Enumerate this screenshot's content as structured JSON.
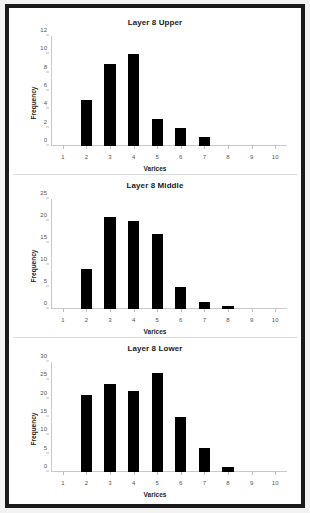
{
  "figure": {
    "background": "#ffffff",
    "frame_color": "#1a1a1a",
    "bar_color": "#000000",
    "axis_color": "#c9c9c9"
  },
  "chart_data": [
    {
      "type": "bar",
      "title": "Layer 8 Upper",
      "xlabel": "Varices",
      "ylabel": "Frequency",
      "categories": [
        "1",
        "2",
        "3",
        "4",
        "5",
        "6",
        "7",
        "8",
        "9",
        "10"
      ],
      "values": [
        0,
        5,
        9,
        10,
        3,
        2,
        1,
        0,
        0,
        0
      ],
      "ylim": [
        0,
        12
      ],
      "yticks": [
        0,
        2,
        4,
        6,
        8,
        10,
        12
      ],
      "grid": false,
      "legend": "none"
    },
    {
      "type": "bar",
      "title": "Layer 8 Middle",
      "xlabel": "Varices",
      "ylabel": "Frequency",
      "categories": [
        "1",
        "2",
        "3",
        "4",
        "5",
        "6",
        "7",
        "8",
        "9",
        "10"
      ],
      "values": [
        0,
        9,
        21,
        20,
        17,
        5,
        1.5,
        0.7,
        0,
        0
      ],
      "ylim": [
        0,
        25
      ],
      "yticks": [
        0,
        5,
        10,
        15,
        20,
        25
      ],
      "grid": false,
      "legend": "none"
    },
    {
      "type": "bar",
      "title": "Layer 8 Lower",
      "xlabel": "Varices",
      "ylabel": "Frequency",
      "categories": [
        "1",
        "2",
        "3",
        "4",
        "5",
        "6",
        "7",
        "8",
        "9",
        "10"
      ],
      "values": [
        0,
        21,
        24,
        22,
        27,
        15,
        6.5,
        1.3,
        0,
        0
      ],
      "ylim": [
        0,
        30
      ],
      "yticks": [
        0,
        5,
        10,
        15,
        20,
        25,
        30
      ],
      "grid": false,
      "legend": "none"
    }
  ]
}
